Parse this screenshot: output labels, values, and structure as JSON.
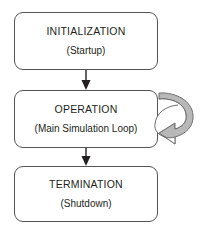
{
  "diagram": {
    "type": "flowchart",
    "orientation": "vertical",
    "background_color": "#ffffff",
    "box_border_color": "#555555",
    "text_color": "#231f20",
    "connector_color": "#231f20",
    "loop_arrow_fill": "#b8b8b8",
    "loop_arrow_stroke": "#6e6e6e",
    "nodes": [
      {
        "id": "initialization",
        "title": "INITIALIZATION",
        "subtitle": "(Startup)",
        "shape": "rounded-rectangle"
      },
      {
        "id": "operation",
        "title": "OPERATION",
        "subtitle": "(Main Simulation Loop)",
        "shape": "rounded-rectangle"
      },
      {
        "id": "termination",
        "title": "TERMINATION",
        "subtitle": "(Shutdown)",
        "shape": "rounded-rectangle"
      }
    ],
    "edges": [
      {
        "id": "edge-init-to-operation",
        "from": "initialization",
        "to": "operation",
        "style": "straight-arrow-down"
      },
      {
        "id": "edge-operation-to-termination",
        "from": "operation",
        "to": "termination",
        "style": "straight-arrow-down"
      },
      {
        "id": "edge-operation-self-loop",
        "from": "operation",
        "to": "operation",
        "style": "curved-block-arrow-loop"
      }
    ]
  }
}
